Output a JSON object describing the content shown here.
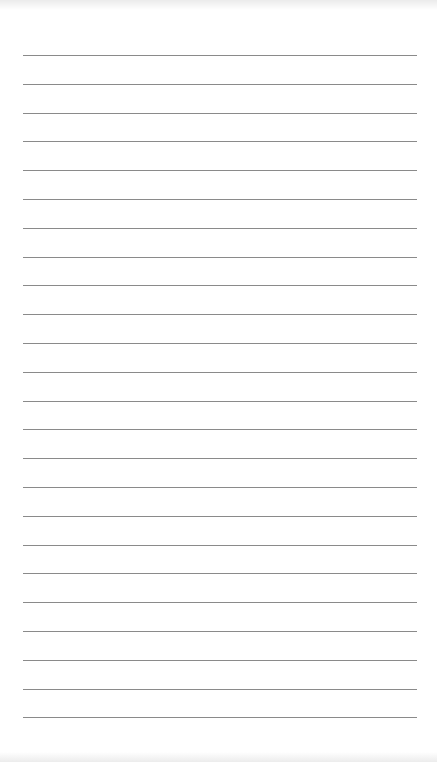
{
  "page": {
    "type": "lined-notepad-paper",
    "background_color": "#ffffff",
    "line_color": "#8a8a8a",
    "line_count": 24,
    "first_line_y": 55,
    "line_spacing": 28.8,
    "line_left": 23,
    "line_width": 394
  }
}
